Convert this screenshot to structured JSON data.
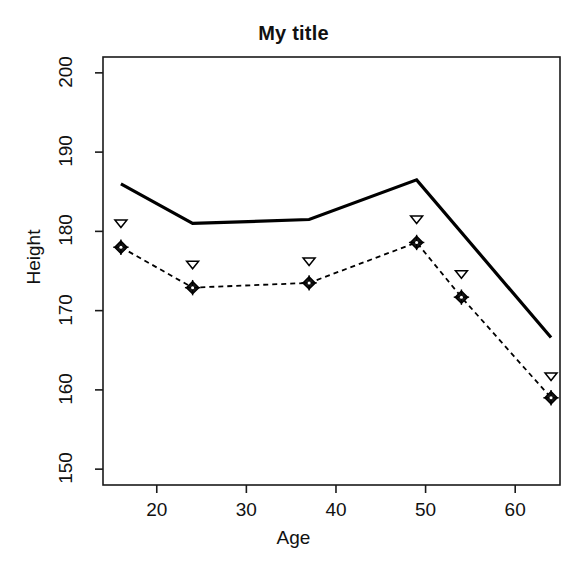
{
  "chart_data": {
    "type": "line",
    "title": "My title",
    "xlabel": "Age",
    "ylabel": "Height",
    "x": [
      16,
      24,
      37,
      49,
      54,
      64
    ],
    "xlim": [
      14,
      65
    ],
    "ylim": [
      148,
      202
    ],
    "xticks": [
      20,
      30,
      40,
      50,
      60
    ],
    "yticks": [
      150,
      160,
      170,
      180,
      190,
      200
    ],
    "xtick_labels": [
      "20",
      "30",
      "40",
      "50",
      "60"
    ],
    "ytick_labels": [
      "150",
      "160",
      "170",
      "180",
      "190",
      "200"
    ],
    "grid": false,
    "legend": "none",
    "series": [
      {
        "name": "solid-line",
        "style": "solid",
        "marker": "none",
        "color": "#000000",
        "linewidth": 3.2,
        "x": [
          16,
          24,
          37,
          49,
          64
        ],
        "values": [
          186.0,
          181.0,
          181.5,
          186.5,
          166.6
        ]
      },
      {
        "name": "triangle-points",
        "style": "none",
        "marker": "triangle-down-open",
        "color": "#000000",
        "linewidth": 0,
        "x": [
          16,
          24,
          37,
          49,
          54,
          64
        ],
        "values": [
          181.0,
          175.8,
          176.2,
          181.5,
          174.6,
          161.7
        ]
      },
      {
        "name": "dashed-diamond-line",
        "style": "dashed",
        "marker": "diamond-plus",
        "color": "#000000",
        "linewidth": 1.8,
        "x": [
          16,
          24,
          37,
          49,
          54,
          64
        ],
        "values": [
          178.0,
          172.9,
          173.5,
          178.6,
          171.7,
          159.0
        ]
      }
    ]
  },
  "axes": {
    "box_left": 103,
    "box_right": 560,
    "box_top": 57,
    "box_bottom": 485,
    "frame_color": "#1a1a1a",
    "frame_width": 1.6,
    "tick_length": 8
  }
}
